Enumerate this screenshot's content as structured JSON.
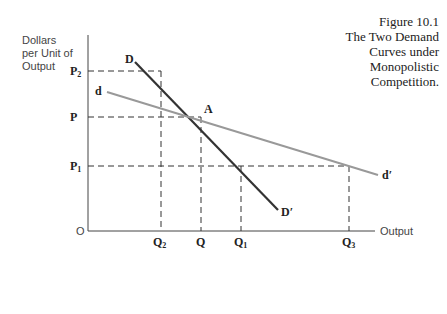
{
  "figure": {
    "number": "Figure 10.1",
    "title_lines": [
      "The Two Demand",
      "Curves under",
      "Monopolistic",
      "Competition."
    ]
  },
  "axes": {
    "y_label_lines": [
      "Dollars",
      "per Unit of",
      "Output"
    ],
    "x_label": "Output",
    "origin_label": "O"
  },
  "price_labels": {
    "p2": {
      "main": "P",
      "sub": "2"
    },
    "p": {
      "main": "P"
    },
    "p1": {
      "main": "P",
      "sub": "1"
    }
  },
  "quantity_labels": {
    "q2": {
      "main": "Q",
      "sub": "2"
    },
    "q": {
      "main": "Q"
    },
    "q1": {
      "main": "Q",
      "sub": "1"
    },
    "q3": {
      "main": "Q",
      "sub": "3"
    }
  },
  "curve_labels": {
    "D_start": "D",
    "D_end": "D′",
    "d_start": "d",
    "d_end": "d′",
    "intersection": "A"
  },
  "colors": {
    "D_curve": "#333333",
    "d_curve": "#999999",
    "axes": "#444444",
    "dashed": "#333333"
  }
}
